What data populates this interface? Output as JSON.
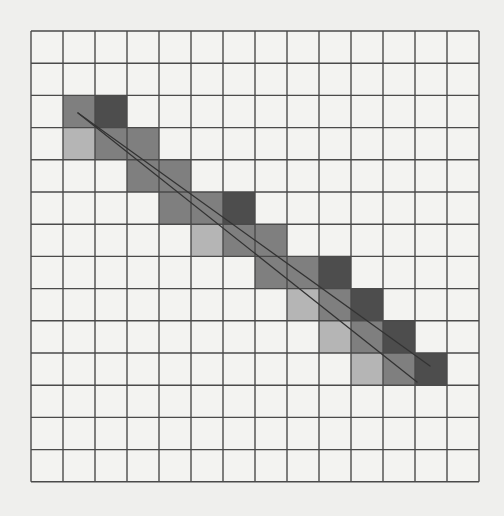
{
  "figure": {
    "background_color": "#efefed",
    "grid": {
      "rows": 14,
      "cols": 14,
      "origin_x": 31,
      "origin_y": 31,
      "cell_w": 32.0,
      "cell_h": 32.2,
      "line_color": "#4a4a4a",
      "cell_fill": "#f3f3f1"
    },
    "shade_colors": {
      "dark": "#4d4d4d",
      "medium": "#7f7f7f",
      "light": "#b5b5b5"
    },
    "shaded_cells": [
      {
        "row": 2,
        "col": 1,
        "shade": "medium"
      },
      {
        "row": 2,
        "col": 2,
        "shade": "dark"
      },
      {
        "row": 3,
        "col": 1,
        "shade": "light"
      },
      {
        "row": 3,
        "col": 2,
        "shade": "medium"
      },
      {
        "row": 3,
        "col": 3,
        "shade": "medium"
      },
      {
        "row": 4,
        "col": 3,
        "shade": "medium"
      },
      {
        "row": 4,
        "col": 4,
        "shade": "medium"
      },
      {
        "row": 5,
        "col": 4,
        "shade": "medium"
      },
      {
        "row": 5,
        "col": 5,
        "shade": "medium"
      },
      {
        "row": 5,
        "col": 6,
        "shade": "dark"
      },
      {
        "row": 6,
        "col": 5,
        "shade": "light"
      },
      {
        "row": 6,
        "col": 6,
        "shade": "medium"
      },
      {
        "row": 6,
        "col": 7,
        "shade": "medium"
      },
      {
        "row": 7,
        "col": 7,
        "shade": "medium"
      },
      {
        "row": 7,
        "col": 8,
        "shade": "medium"
      },
      {
        "row": 7,
        "col": 9,
        "shade": "dark"
      },
      {
        "row": 8,
        "col": 8,
        "shade": "light"
      },
      {
        "row": 8,
        "col": 9,
        "shade": "medium"
      },
      {
        "row": 8,
        "col": 10,
        "shade": "dark"
      },
      {
        "row": 9,
        "col": 9,
        "shade": "light"
      },
      {
        "row": 9,
        "col": 10,
        "shade": "medium"
      },
      {
        "row": 9,
        "col": 11,
        "shade": "dark"
      },
      {
        "row": 10,
        "col": 10,
        "shade": "light"
      },
      {
        "row": 10,
        "col": 11,
        "shade": "medium"
      },
      {
        "row": 10,
        "col": 12,
        "shade": "dark"
      }
    ],
    "segments": [
      {
        "name": "upper-line",
        "x1": 78,
        "y1": 113,
        "x2": 430,
        "y2": 366,
        "color": "#333333"
      },
      {
        "name": "lower-line",
        "x1": 78,
        "y1": 113,
        "x2": 417,
        "y2": 382,
        "color": "#333333"
      }
    ]
  }
}
